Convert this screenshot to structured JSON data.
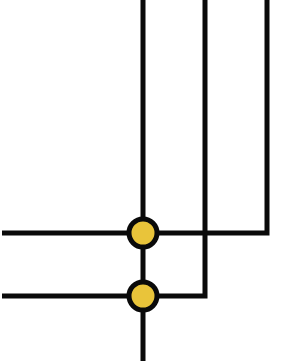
{
  "diagram": {
    "width": 305,
    "height": 361,
    "background": "#ffffff",
    "line_color": "#0a0a0a",
    "line_width": 5,
    "node_fill": "#E9C43A",
    "node_stroke": "#0a0a0a",
    "node_stroke_width": 5,
    "node_radius": 14,
    "wires": [
      {
        "id": "center-vertical",
        "points": [
          [
            143,
            0
          ],
          [
            143,
            361
          ]
        ]
      },
      {
        "id": "middle-wire",
        "points": [
          [
            205,
            0
          ],
          [
            205,
            296
          ],
          [
            2,
            296
          ]
        ]
      },
      {
        "id": "right-wire",
        "points": [
          [
            267,
            0
          ],
          [
            267,
            233
          ],
          [
            2,
            233
          ]
        ]
      }
    ],
    "junctions": [
      {
        "id": "junction-upper",
        "cx": 143,
        "cy": 233
      },
      {
        "id": "junction-lower",
        "cx": 143,
        "cy": 296
      }
    ]
  }
}
